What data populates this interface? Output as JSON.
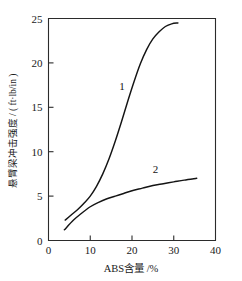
{
  "chart_data": {
    "type": "line",
    "title": "",
    "xlabel": "ABS含量 /%",
    "ylabel": "悬臂梁冲击强度 / ( ft·lb/in )",
    "xlim": [
      0,
      40
    ],
    "ylim": [
      0,
      25
    ],
    "xticks": [
      "0",
      "10",
      "20",
      "30",
      "40"
    ],
    "xtick_values": [
      0,
      10,
      20,
      30,
      40
    ],
    "yticks": [
      "0",
      "5",
      "10",
      "15",
      "20",
      "25"
    ],
    "ytick_values": [
      0,
      5,
      10,
      15,
      20,
      25
    ],
    "grid": false,
    "legend": "inline-curve-labels",
    "series": [
      {
        "name": "1",
        "label": "1",
        "label_x": 17.6,
        "label_y": 16.9,
        "x": [
          4.0,
          5.5,
          7.0,
          8.5,
          10.0,
          11.5,
          13.0,
          14.5,
          16.0,
          17.5,
          19.0,
          20.5,
          22.0,
          23.5,
          25.0,
          26.5,
          28.0,
          29.5,
          31.0
        ],
        "y": [
          2.3,
          2.9,
          3.5,
          4.2,
          5.0,
          6.1,
          7.5,
          9.2,
          11.2,
          13.4,
          15.7,
          17.9,
          19.9,
          21.5,
          22.7,
          23.5,
          24.1,
          24.4,
          24.5
        ]
      },
      {
        "name": "2",
        "label": "2",
        "label_x": 25.6,
        "label_y": 7.6,
        "x": [
          3.8,
          6.0,
          8.0,
          10.0,
          12.0,
          14.0,
          16.0,
          18.0,
          20.0,
          22.5,
          25.0,
          27.5,
          30.0,
          32.5,
          35.5
        ],
        "y": [
          1.2,
          2.3,
          3.1,
          3.8,
          4.3,
          4.7,
          5.0,
          5.3,
          5.6,
          5.9,
          6.2,
          6.4,
          6.6,
          6.8,
          7.0
        ]
      }
    ]
  }
}
